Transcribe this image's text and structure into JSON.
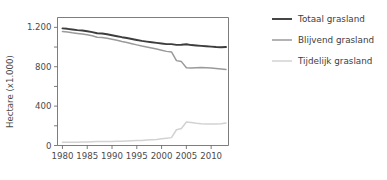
{
  "chart_data": {
    "type": "line",
    "title": "",
    "subtitle": "",
    "xlabel": "",
    "ylabel": "Hectare (x1.000)",
    "xlim": [
      1979,
      2013.5
    ],
    "ylim": [
      0,
      1300
    ],
    "grid": false,
    "legend_position": "right",
    "x_ticks": [
      1980,
      1985,
      1990,
      1995,
      2000,
      2005,
      2010
    ],
    "x_tick_labels": [
      "1980",
      "1985",
      "1990",
      "1995",
      "2000",
      "2005",
      "2010"
    ],
    "y_ticks": [
      0,
      200,
      400,
      600,
      800,
      1000,
      1200
    ],
    "y_tick_labels": [
      "0",
      "",
      "400",
      "",
      "800",
      "",
      "1.200"
    ],
    "y_labeled_ticks": [
      {
        "value": 0,
        "label": "0"
      },
      {
        "value": 400,
        "label": "400"
      },
      {
        "value": 800,
        "label": "800"
      },
      {
        "value": 1200,
        "label": "1.200"
      }
    ],
    "x": [
      1980,
      1981,
      1982,
      1983,
      1984,
      1985,
      1986,
      1987,
      1988,
      1989,
      1990,
      1991,
      1992,
      1993,
      1994,
      1995,
      1996,
      1997,
      1998,
      1999,
      2000,
      2001,
      2002,
      2003,
      2004,
      2005,
      2006,
      2007,
      2008,
      2009,
      2010,
      2011,
      2012,
      2013
    ],
    "series": [
      {
        "name": "Totaal grasland",
        "color": "#3d3d3d",
        "width": 1.9,
        "values": [
          1190,
          1185,
          1178,
          1172,
          1168,
          1160,
          1152,
          1140,
          1138,
          1130,
          1120,
          1110,
          1100,
          1092,
          1082,
          1072,
          1062,
          1055,
          1048,
          1042,
          1036,
          1030,
          1030,
          1022,
          1024,
          1028,
          1020,
          1016,
          1012,
          1008,
          1004,
          1000,
          998,
          1000
        ]
      },
      {
        "name": "Blijvend grasland",
        "color": "#9a9a9a",
        "width": 1.5,
        "values": [
          1158,
          1152,
          1144,
          1138,
          1132,
          1124,
          1114,
          1100,
          1098,
          1090,
          1080,
          1068,
          1056,
          1046,
          1034,
          1022,
          1010,
          1000,
          990,
          980,
          968,
          956,
          950,
          862,
          852,
          790,
          786,
          790,
          792,
          790,
          786,
          782,
          778,
          772
        ]
      },
      {
        "name": "Tijdelijk grasland",
        "color": "#d2d2d2",
        "width": 1.5,
        "values": [
          32,
          33,
          34,
          34,
          36,
          36,
          38,
          40,
          40,
          40,
          40,
          42,
          44,
          46,
          48,
          50,
          52,
          55,
          58,
          62,
          68,
          74,
          80,
          160,
          172,
          238,
          234,
          226,
          220,
          218,
          218,
          218,
          220,
          228
        ]
      }
    ]
  },
  "legend": {
    "items": [
      {
        "label": "Totaal grasland",
        "color": "#3d3d3d",
        "width": 1.9
      },
      {
        "label": "Blijvend grasland",
        "color": "#9a9a9a",
        "width": 1.5
      },
      {
        "label": "Tijdelijk grasland",
        "color": "#d2d2d2",
        "width": 1.5
      }
    ]
  }
}
